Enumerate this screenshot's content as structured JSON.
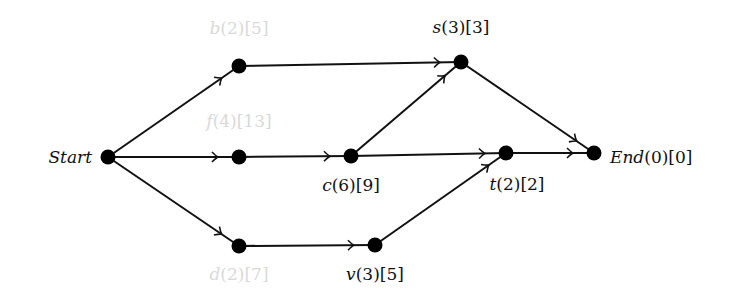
{
  "diagram": {
    "type": "directed-network",
    "nodes": [
      {
        "id": "start",
        "name": "Start",
        "label": "Start",
        "faded": false
      },
      {
        "id": "b",
        "name": "b",
        "label": "b(2)[5]",
        "faded": true
      },
      {
        "id": "s",
        "name": "s",
        "label": "s(3)[3]",
        "faded": false
      },
      {
        "id": "f",
        "name": "f",
        "label": "f(4)[13]",
        "faded": true
      },
      {
        "id": "c",
        "name": "c",
        "label": "c(6)[9]",
        "faded": false
      },
      {
        "id": "t",
        "name": "t",
        "label": "t(2)[2]",
        "faded": false
      },
      {
        "id": "end",
        "name": "End",
        "label": "End(0)[0]",
        "faded": false
      },
      {
        "id": "d",
        "name": "d",
        "label": "d(2)[7]",
        "faded": true
      },
      {
        "id": "v",
        "name": "v",
        "label": "v(3)[5]",
        "faded": false
      }
    ],
    "edges": [
      {
        "from": "start",
        "to": "b"
      },
      {
        "from": "start",
        "to": "f"
      },
      {
        "from": "start",
        "to": "d"
      },
      {
        "from": "b",
        "to": "s"
      },
      {
        "from": "f",
        "to": "c"
      },
      {
        "from": "c",
        "to": "s"
      },
      {
        "from": "c",
        "to": "t"
      },
      {
        "from": "d",
        "to": "v"
      },
      {
        "from": "v",
        "to": "t"
      },
      {
        "from": "s",
        "to": "end"
      },
      {
        "from": "t",
        "to": "end"
      }
    ]
  }
}
